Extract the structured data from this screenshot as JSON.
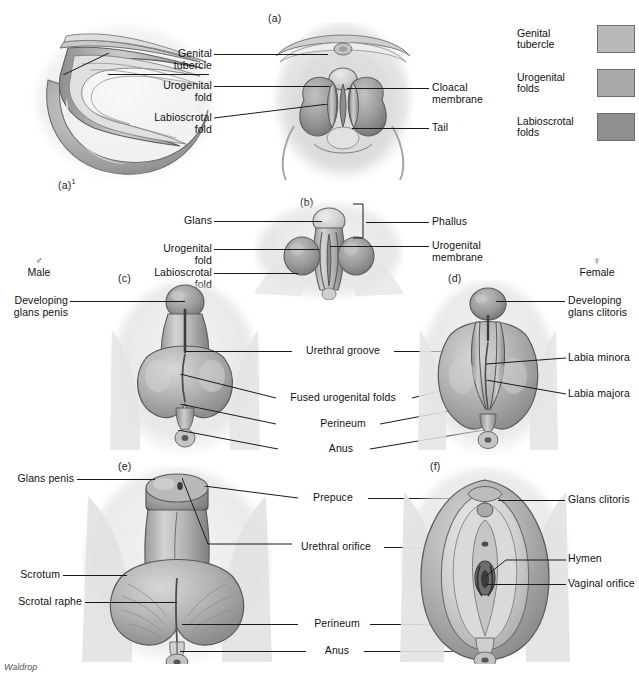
{
  "figure": {
    "credit": "Waldrop",
    "top_caption_partial": "",
    "panel_letters": {
      "a_section": "(a)",
      "a_prime": "(a)",
      "a_prime_sup": "1",
      "b": "(b)",
      "c": "(c)",
      "d": "(d)",
      "e": "(e)",
      "f": "(f)"
    }
  },
  "legend": {
    "items": [
      {
        "label": "Genital\ntubercle",
        "color": "#b9b9b9",
        "name": "genital-tubercle"
      },
      {
        "label": "Urogenital\nfolds",
        "color": "#a9a9a9",
        "name": "urogenital-folds"
      },
      {
        "label": "Labioscrotal\nfolds",
        "color": "#8f8f8f",
        "name": "labioscrotal-folds"
      }
    ]
  },
  "sex_headers": {
    "male": {
      "symbol": "♂",
      "label": "Male"
    },
    "female": {
      "symbol": "♀",
      "label": "Female"
    }
  },
  "row_a": {
    "left_labels": [
      "Genital\ntubercle",
      "Urogenital\nfold",
      "Labioscrotal\nfold"
    ],
    "right_labels": [
      "Cloacal\nmembrane",
      "Tail"
    ]
  },
  "row_b": {
    "left_labels": [
      "Glans",
      "Urogenital\nfold",
      "Labioscrotal\nfold"
    ],
    "right_labels": [
      "Phallus",
      "Urogenital\nmembrane"
    ]
  },
  "row_cd": {
    "left_labels": [
      "Developing\nglans penis"
    ],
    "center_labels": [
      "Urethral groove",
      "Fused urogenital folds",
      "Perineum",
      "Anus"
    ],
    "right_labels": [
      "Developing\nglans clitoris",
      "Labia minora",
      "Labia majora"
    ]
  },
  "row_ef": {
    "left_labels": [
      "Glans penis",
      "Scrotum",
      "Scrotal raphe"
    ],
    "center_labels": [
      "Prepuce",
      "Urethral orifice",
      "Perineum",
      "Anus"
    ],
    "right_labels": [
      "Glans clitoris",
      "Hymen",
      "Vaginal orifice"
    ]
  },
  "colors": {
    "ink": "#1a1a1a",
    "tissue_light": "#c9c9c9",
    "tissue_mid": "#a8a8a8",
    "tissue_dark": "#8a8a8a",
    "background": "#ffffff"
  }
}
